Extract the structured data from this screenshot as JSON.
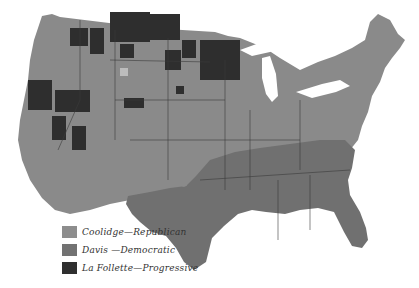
{
  "map": {
    "title": "1924 Presidential Election by County",
    "colors": {
      "republican": "#8a8a8a",
      "democratic": "#6f6f6f",
      "progressive": "#2e2e2e",
      "background": "#ffffff",
      "border": "#3a3a3a"
    }
  },
  "legend": {
    "items": [
      {
        "label": "Coolidge—Republican",
        "color": "#8d8d8d",
        "party": "republican"
      },
      {
        "label": "Davis —Democratic",
        "color": "#727272",
        "party": "democratic"
      },
      {
        "label": "La Follette—Progressive",
        "color": "#2f2f2f",
        "party": "progressive"
      }
    ]
  }
}
